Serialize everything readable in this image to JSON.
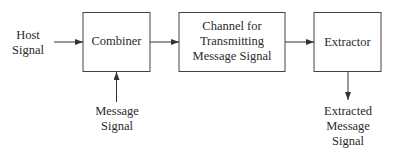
{
  "diagram": {
    "inputs": {
      "host_signal": [
        "Host",
        "Signal"
      ],
      "message_signal": [
        "Message",
        "Signal"
      ]
    },
    "blocks": {
      "combiner": [
        "Combiner"
      ],
      "channel": [
        "Channel for",
        "Transmitting",
        "Message Signal"
      ],
      "extractor": [
        "Extractor"
      ]
    },
    "outputs": {
      "extracted_message_signal": [
        "Extracted",
        "Message",
        "Signal"
      ]
    },
    "colors": {
      "line": "#333333",
      "background": "#ffffff"
    }
  }
}
